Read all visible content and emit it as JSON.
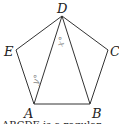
{
  "figure": {
    "shape": "regular pentagon ABCDE with diagonals DA and DB",
    "vertices": {
      "D": {
        "label": "D",
        "x": 62,
        "y": 16
      },
      "E": {
        "label": "E",
        "x": 16,
        "y": 50
      },
      "C": {
        "label": "C",
        "x": 108,
        "y": 50
      },
      "A": {
        "label": "A",
        "x": 34,
        "y": 104
      },
      "B": {
        "label": "B",
        "x": 90,
        "y": 104
      }
    },
    "angles": {
      "x": {
        "label": "x°"
      },
      "y": {
        "label": "y°"
      }
    },
    "caption": "ABCDE is a regular"
  }
}
